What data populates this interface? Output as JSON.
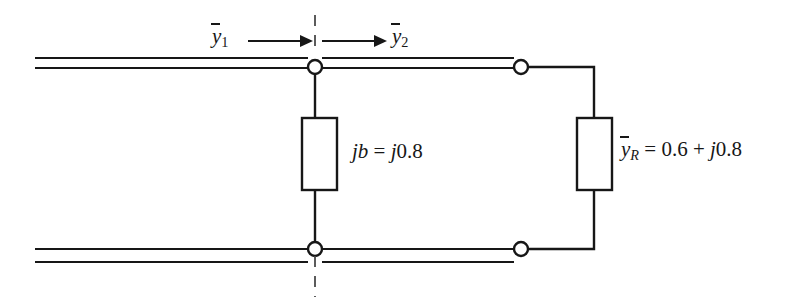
{
  "figure": {
    "type": "circuit-diagram",
    "width": 785,
    "height": 307,
    "stroke_color": "#171717",
    "background_color": "#ffffff"
  },
  "labels": {
    "y1": {
      "symbol": "y",
      "overbar": true,
      "subscript": "1",
      "text": "ỷ1"
    },
    "y2": {
      "symbol": "y",
      "overbar": true,
      "subscript": "2",
      "text": "ỷ2"
    },
    "shunt": {
      "symbol": "jb",
      "equals": "=",
      "value": "j0.8",
      "text": "jb = j0.8"
    },
    "load": {
      "symbol": "y",
      "overbar": true,
      "subscript": "R",
      "equals": "=",
      "real": "0.6",
      "plus": "+",
      "imag": "j0.8",
      "text": "ỷR = 0.6 + j0.8"
    }
  },
  "components": {
    "shunt_box": {
      "name": "shunt-susceptance-element",
      "x": 302,
      "y": 118,
      "width": 35,
      "height": 72
    },
    "load_box": {
      "name": "load-admittance-element",
      "x": 577,
      "y": 118,
      "width": 35,
      "height": 72
    },
    "nodes": [
      {
        "name": "top-junction-node",
        "cx": 315,
        "cy": 67,
        "r": 7
      },
      {
        "name": "top-load-node",
        "cx": 521,
        "cy": 67,
        "r": 7
      },
      {
        "name": "bottom-junction-node",
        "cx": 315,
        "cy": 249,
        "r": 7
      },
      {
        "name": "bottom-load-node",
        "cx": 521,
        "cy": 249,
        "r": 7
      }
    ],
    "reference_plane": {
      "name": "reference-plane-dashed-line",
      "x": 315,
      "y1": 15,
      "y2": 297
    },
    "arrows": [
      {
        "name": "y1-direction-arrow",
        "x1": 248,
        "x2": 312,
        "y": 41,
        "direction": "right"
      },
      {
        "name": "y2-direction-arrow",
        "x1": 322,
        "x2": 386,
        "y": 41,
        "direction": "right"
      }
    ]
  }
}
